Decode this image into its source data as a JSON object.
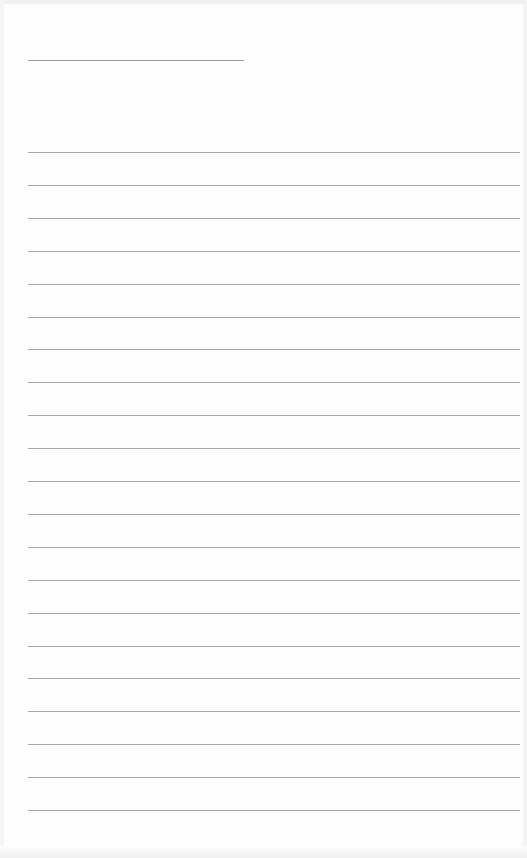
{
  "page": {
    "type": "lined-paper",
    "background_color": "#fdfdfd",
    "line_color": "#a8a8a8",
    "header_line": {
      "left": 28,
      "top": 60,
      "width": 216
    },
    "ruled_lines": {
      "count": 21,
      "left": 28,
      "width": 492,
      "first_top": 152,
      "spacing": 32.9
    }
  }
}
